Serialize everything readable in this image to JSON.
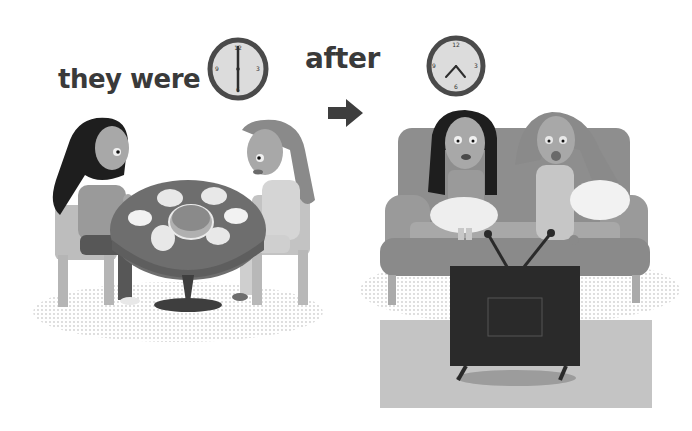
{
  "illustration": {
    "before_panel": {
      "caption": "they were",
      "clock": {
        "time": "6:00",
        "numerals": [
          "12",
          "3",
          "6",
          "9"
        ]
      },
      "scene": "two girls eating together at a round dining table"
    },
    "transition": {
      "arrow_icon": "right-arrow-icon"
    },
    "after_panel": {
      "caption": "after",
      "clock": {
        "time": "7:25",
        "numerals": [
          "12",
          "3",
          "6",
          "9"
        ]
      },
      "scene": "two girls sitting on a sofa watching television"
    },
    "colors": {
      "text": "#3a3a3a",
      "clock_face": "#dcdcdc",
      "clock_rim": "#4a4a4a",
      "table": "#6e6e6e",
      "sofa": "#8e8e8e",
      "tv": "#2a2a2a",
      "rug": "#c4c4c4",
      "chair": "#bdbdbd",
      "hair_dark": "#1e1e1e",
      "hair_light": "#8a8a8a",
      "skin": "#a8a8a8"
    }
  }
}
